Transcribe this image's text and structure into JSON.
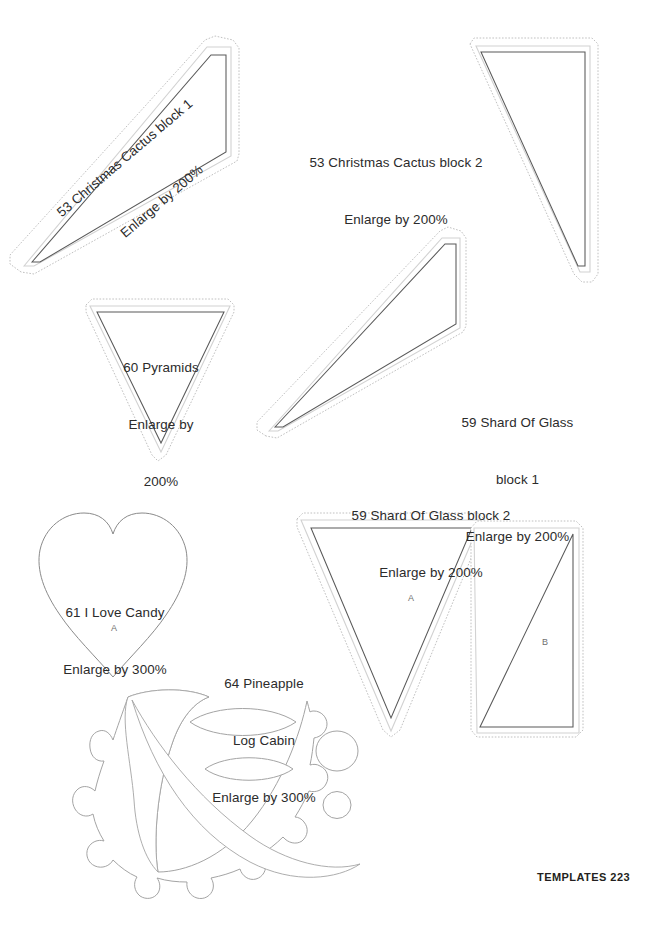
{
  "page": {
    "footer_text": "TEMPLATES  223",
    "background_color": "#ffffff",
    "cut_line_color": "#6e6e6e",
    "seam_line_color": "#cfcfcf",
    "dashed_line_color": "#b9b9b9",
    "width": 653,
    "height": 933
  },
  "templates": [
    {
      "id": "christmas-cactus-block-1",
      "line1": "53 Christmas Cactus block 1",
      "line2": "Enlarge by 200%",
      "shape": "quadrilateral",
      "enlarge": "200%",
      "rotated_label": true
    },
    {
      "id": "christmas-cactus-block-2",
      "line1": "53 Christmas Cactus block 2",
      "line2": "Enlarge by 200%",
      "shape": "right-triangle",
      "enlarge": "200%",
      "rotated_label": false
    },
    {
      "id": "pyramids",
      "line1": "60 Pyramids",
      "line2": "Enlarge by",
      "line3": "200%",
      "shape": "down-triangle",
      "enlarge": "200%",
      "rotated_label": false
    },
    {
      "id": "shard-of-glass-block-1",
      "line1": "59 Shard Of Glass",
      "line2": "block 1",
      "line3": "Enlarge by 200%",
      "shape": "quadrilateral",
      "enlarge": "200%",
      "rotated_label": false
    },
    {
      "id": "shard-of-glass-block-2",
      "line1": "59 Shard Of Glass block 2",
      "line2": "Enlarge by 200%",
      "shape": "down-triangle-and-right-triangle",
      "enlarge": "200%",
      "rotated_label": false,
      "piece_marks": [
        "A",
        "B"
      ]
    },
    {
      "id": "i-love-candy",
      "line1": "61 I Love Candy",
      "line2": "Enlarge by 300%",
      "shape": "heart",
      "enlarge": "300%",
      "rotated_label": false,
      "piece_marks": [
        "A"
      ]
    },
    {
      "id": "pineapple-log-cabin",
      "line1": "64 Pineapple",
      "line2": "Log Cabin",
      "line3": "Enlarge by 300%",
      "shape": "scalloped-crescent-leaves-circles",
      "enlarge": "300%",
      "rotated_label": false
    }
  ],
  "piece_marks": {
    "heart_a": "A",
    "shard_triangle_a": "A",
    "shard_triangle_b": "B"
  }
}
